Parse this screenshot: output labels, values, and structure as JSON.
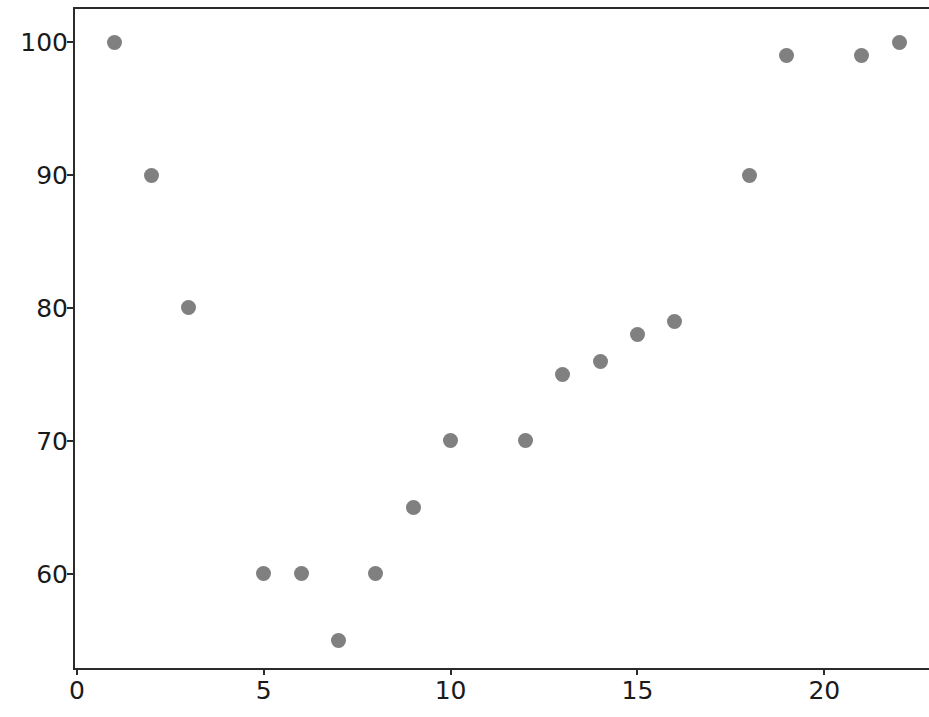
{
  "chart_data": {
    "type": "scatter",
    "title": "",
    "xlabel": "",
    "ylabel": "",
    "x": [
      1,
      2,
      3,
      5,
      6,
      7,
      8,
      9,
      10,
      12,
      13,
      14,
      15,
      16,
      18,
      19,
      21,
      22
    ],
    "y": [
      100,
      90,
      80,
      60,
      60,
      55,
      60,
      65,
      70,
      70,
      75,
      76,
      78,
      79,
      90,
      99,
      99,
      100
    ],
    "points": [
      {
        "x": 1,
        "y": 100
      },
      {
        "x": 2,
        "y": 90
      },
      {
        "x": 3,
        "y": 80
      },
      {
        "x": 5,
        "y": 60
      },
      {
        "x": 6,
        "y": 60
      },
      {
        "x": 7,
        "y": 55
      },
      {
        "x": 8,
        "y": 60
      },
      {
        "x": 9,
        "y": 65
      },
      {
        "x": 10,
        "y": 70
      },
      {
        "x": 12,
        "y": 70
      },
      {
        "x": 13,
        "y": 75
      },
      {
        "x": 14,
        "y": 76
      },
      {
        "x": 15,
        "y": 78
      },
      {
        "x": 16,
        "y": 79
      },
      {
        "x": 18,
        "y": 90
      },
      {
        "x": 19,
        "y": 99
      },
      {
        "x": 21,
        "y": 99
      },
      {
        "x": 22,
        "y": 100
      }
    ],
    "xlim": [
      -0.05,
      22.8
    ],
    "ylim": [
      52.9,
      102.5
    ],
    "xticks": [
      0,
      5,
      10,
      15,
      20
    ],
    "xtick_labels": [
      "0",
      "5",
      "10",
      "15",
      "20"
    ],
    "yticks": [
      60,
      70,
      80,
      90,
      100
    ],
    "ytick_labels": [
      "60",
      "70",
      "80",
      "90",
      "100"
    ],
    "grid": false,
    "legend": null,
    "marker_color": "#808080",
    "marker_size": 15,
    "axis_color": "#2b2b2b",
    "background_color": "#ffffff"
  }
}
